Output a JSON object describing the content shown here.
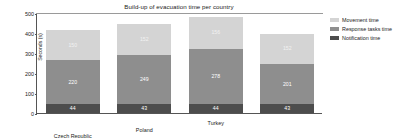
{
  "chart_data": {
    "type": "bar",
    "barmode": "stacked",
    "title": "Build-up of evacuation time per country",
    "xlabel": "",
    "ylabel": "Seconds (s)",
    "ylim": [
      0,
      500
    ],
    "yticks": [
      0,
      100,
      200,
      300,
      400,
      500
    ],
    "ytick_labels": [
      "0",
      "100",
      "200",
      "300",
      "400",
      "500"
    ],
    "grid": false,
    "legend_position": "right",
    "categories": [
      "Czech Republic",
      "Poland",
      "Turkey",
      "UK"
    ],
    "series": [
      {
        "name": "Movement time",
        "color": "#d4d4d4",
        "values": [
          150,
          152,
          156,
          152
        ],
        "labels": [
          "150",
          "152",
          "156",
          "152"
        ]
      },
      {
        "name": "Response tasks time",
        "color": "#8e8e8e",
        "values": [
          220,
          249,
          278,
          201
        ],
        "labels": [
          "220",
          "249",
          "278",
          "201"
        ]
      },
      {
        "name": "Notification time",
        "color": "#4d4d4d",
        "values": [
          44,
          43,
          44,
          43
        ],
        "labels": [
          "44",
          "43",
          "44",
          "43"
        ]
      }
    ],
    "stack_order_bottom_to_top": [
      "Notification time",
      "Response tasks time",
      "Movement time"
    ],
    "totals": [
      414,
      444,
      478,
      396
    ]
  },
  "legend": {
    "items": [
      {
        "label": "Movement time",
        "color": "#d4d4d4"
      },
      {
        "label": "Response tasks time",
        "color": "#8e8e8e"
      },
      {
        "label": "Notification time",
        "color": "#4d4d4d"
      }
    ]
  }
}
